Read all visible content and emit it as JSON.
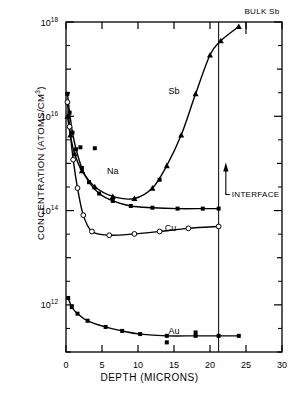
{
  "figure": {
    "title": "",
    "y_axis_title": "CONCENTRATION (ATOMS/CM",
    "y_axis_title_sup": "3",
    "y_axis_title_tail": ")",
    "x_axis_title": "DEPTH (MICRONS)"
  },
  "annotations": {
    "bulk_sb": "BULK  Sb",
    "interface": "INTERFACE"
  },
  "series_labels": {
    "na": "Na",
    "sb": "Sb",
    "cu": "Cu",
    "au": "Au"
  },
  "x_ticks": [
    "0",
    "5",
    "10",
    "15",
    "20",
    "25",
    "30"
  ],
  "y_ticks": [
    "10",
    "10",
    "10",
    "10"
  ],
  "y_tick_exponents": [
    "18",
    "16",
    "14",
    "12"
  ],
  "colors": {
    "axis": "#000000",
    "curve": "#000000",
    "marker_fill": "#000000",
    "marker_open": "#ffffff",
    "background": "#ffffff"
  },
  "chart_data": {
    "type": "line",
    "title": "",
    "xlabel": "DEPTH (MICRONS)",
    "ylabel": "CONCENTRATION (ATOMS/CM^3)",
    "xlim": [
      0,
      30
    ],
    "ylim": [
      100000000000.0,
      1e+18
    ],
    "yscale": "log",
    "xscale": "linear",
    "grid": false,
    "legend": "inline-labels",
    "x_ticks": [
      0,
      5,
      10,
      15,
      20,
      25,
      30
    ],
    "y_ticks": [
      1000000000000.0,
      100000000000000.0,
      1e+16,
      1e+18
    ],
    "annotations": [
      {
        "text": "BULK  Sb",
        "x": 25.0,
        "y": 1e+18,
        "note": "bulk antimony substrate level, top right"
      },
      {
        "text": "INTERFACE",
        "x": 22.2,
        "y": 220000000000000.0,
        "note": "vertical line at 21.2 microns with upward arrow"
      }
    ],
    "vertical_line_x": 21.2,
    "series": [
      {
        "name": "Na",
        "marker": "filled-square",
        "label_x": 6.5,
        "label_y": 600000000000000.0,
        "points": [
          {
            "x": 0.2,
            "y": 3e+16
          },
          {
            "x": 0.5,
            "y": 1.2e+16
          },
          {
            "x": 0.9,
            "y": 4500000000000000.0
          },
          {
            "x": 1.4,
            "y": 2000000000000000.0
          },
          {
            "x": 2.2,
            "y": 800000000000000.0
          },
          {
            "x": 3.2,
            "y": 400000000000000.0
          },
          {
            "x": 4.6,
            "y": 230000000000000.0
          },
          {
            "x": 6.5,
            "y": 160000000000000.0
          },
          {
            "x": 9.0,
            "y": 125000000000000.0
          },
          {
            "x": 12.0,
            "y": 115000000000000.0
          },
          {
            "x": 15.5,
            "y": 110000000000000.0
          },
          {
            "x": 19.0,
            "y": 110000000000000.0
          },
          {
            "x": 21.2,
            "y": 110000000000000.0
          }
        ],
        "scatter_only": [
          {
            "x": 2.0,
            "y": 2200000000000000.0
          },
          {
            "x": 4.0,
            "y": 2100000000000000.0
          },
          {
            "x": 13.0,
            "y": 450000000000000.0
          }
        ]
      },
      {
        "name": "Sb",
        "marker": "filled-triangle",
        "label_x": 15.0,
        "label_y": 3e+16,
        "points": [
          {
            "x": 0.2,
            "y": 1e+16
          },
          {
            "x": 0.6,
            "y": 4000000000000000.0
          },
          {
            "x": 1.2,
            "y": 1600000000000000.0
          },
          {
            "x": 2.2,
            "y": 700000000000000.0
          },
          {
            "x": 4.0,
            "y": 320000000000000.0
          },
          {
            "x": 6.5,
            "y": 200000000000000.0
          },
          {
            "x": 9.5,
            "y": 180000000000000.0
          },
          {
            "x": 12.0,
            "y": 300000000000000.0
          },
          {
            "x": 14.0,
            "y": 900000000000000.0
          },
          {
            "x": 16.0,
            "y": 4000000000000000.0
          },
          {
            "x": 18.0,
            "y": 3e+16
          },
          {
            "x": 20.0,
            "y": 2e+17
          },
          {
            "x": 21.5,
            "y": 4e+17
          },
          {
            "x": 24.0,
            "y": 8e+17
          }
        ],
        "scatter_only": []
      },
      {
        "name": "Cu",
        "marker": "open-circle",
        "label_x": 14.5,
        "label_y": 36000000000000.0,
        "points": [
          {
            "x": 0.2,
            "y": 2e+16
          },
          {
            "x": 0.5,
            "y": 6000000000000000.0
          },
          {
            "x": 1.0,
            "y": 1200000000000000.0
          },
          {
            "x": 1.6,
            "y": 300000000000000.0
          },
          {
            "x": 2.4,
            "y": 80000000000000.0
          },
          {
            "x": 3.6,
            "y": 36000000000000.0
          },
          {
            "x": 6.0,
            "y": 30000000000000.0
          },
          {
            "x": 9.5,
            "y": 32000000000000.0
          },
          {
            "x": 13.0,
            "y": 36000000000000.0
          },
          {
            "x": 17.0,
            "y": 42000000000000.0
          },
          {
            "x": 21.2,
            "y": 46000000000000.0
          }
        ],
        "scatter_only": []
      },
      {
        "name": "Au",
        "marker": "filled-square",
        "label_x": 15.0,
        "label_y": 240000000000.0,
        "points": [
          {
            "x": 0.3,
            "y": 1400000000000.0
          },
          {
            "x": 0.8,
            "y": 900000000000.0
          },
          {
            "x": 1.6,
            "y": 650000000000.0
          },
          {
            "x": 3.0,
            "y": 460000000000.0
          },
          {
            "x": 5.5,
            "y": 340000000000.0
          },
          {
            "x": 7.8,
            "y": 280000000000.0
          },
          {
            "x": 10.3,
            "y": 240000000000.0
          },
          {
            "x": 14.0,
            "y": 220000000000.0
          },
          {
            "x": 18.0,
            "y": 220000000000.0
          },
          {
            "x": 21.2,
            "y": 220000000000.0
          },
          {
            "x": 24.0,
            "y": 220000000000.0
          }
        ],
        "scatter_only": [
          {
            "x": 18.0,
            "y": 260000000000.0
          },
          {
            "x": 14.0,
            "y": 160000000000.0
          }
        ]
      }
    ]
  }
}
